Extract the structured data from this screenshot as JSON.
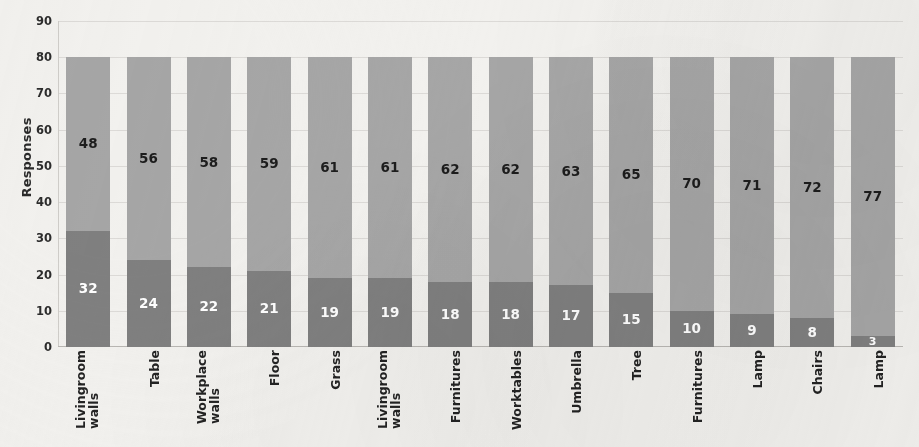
{
  "chart_data": {
    "type": "bar",
    "stacked": true,
    "title": "",
    "subtitle": "",
    "xlabel": "",
    "ylabel": "Responses",
    "ylim": [
      0,
      90
    ],
    "ytick_step": 10,
    "yticks": [
      90,
      80,
      70,
      60,
      50,
      40,
      30,
      20,
      10,
      0
    ],
    "grid": true,
    "legend": "none",
    "categories": [
      "Livingroom walls",
      "Table",
      "Workplace walls",
      "Floor",
      "Grass",
      "Livingroom walls",
      "Furnitures",
      "Worktables",
      "Umbrella",
      "Tree",
      "Furnitures",
      "Lamp",
      "Chairs",
      "Lamp"
    ],
    "category_lines": [
      [
        "Livingroom",
        "walls"
      ],
      [
        "Table"
      ],
      [
        "Workplace",
        "walls"
      ],
      [
        "Floor"
      ],
      [
        "Grass"
      ],
      [
        "Livingroom",
        "walls"
      ],
      [
        "Furnitures"
      ],
      [
        "Worktables"
      ],
      [
        "Umbrella"
      ],
      [
        "Tree"
      ],
      [
        "Furnitures"
      ],
      [
        "Lamp"
      ],
      [
        "Chairs"
      ],
      [
        "Lamp"
      ]
    ],
    "series": [
      {
        "name": "lower",
        "color": "#808080",
        "label_color": "#ffffff",
        "values": [
          32,
          24,
          22,
          21,
          19,
          19,
          18,
          18,
          17,
          15,
          10,
          9,
          8,
          3
        ]
      },
      {
        "name": "upper",
        "color": "#a6a6a6",
        "label_color": "#1d1d1d",
        "values": [
          48,
          56,
          58,
          59,
          61,
          61,
          62,
          62,
          63,
          65,
          70,
          71,
          72,
          77
        ]
      }
    ],
    "totals": [
      80,
      80,
      80,
      80,
      80,
      80,
      80,
      80,
      80,
      80,
      80,
      80,
      80,
      80
    ],
    "colors": {
      "lower_segment": "#808080",
      "upper_segment": "#a6a6a6",
      "background": "#f2f1ee",
      "gridline": "#d8d6d2",
      "text": "#232323"
    }
  }
}
